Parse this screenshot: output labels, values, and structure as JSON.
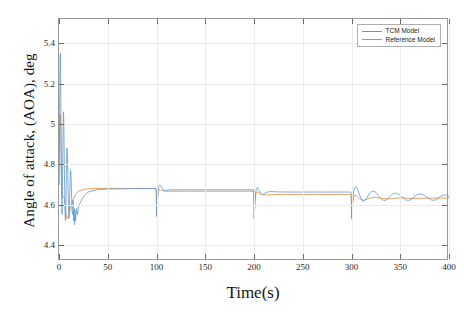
{
  "figure": {
    "background": "#ffffff",
    "top_cut_text": ""
  },
  "axis": {
    "ylabel": "Angle of attack, (AOA), deg",
    "xlabel": "Time(s)",
    "y_ticks": [
      "4.4",
      "4.6",
      "4.8",
      "5",
      "5.2",
      "5.4"
    ],
    "x_ticks": [
      "0",
      "50",
      "100",
      "150",
      "200",
      "250",
      "300",
      "350",
      "400"
    ]
  },
  "legend": {
    "position": "top-right",
    "items": [
      {
        "label": "TCM Model",
        "color": "#5B9BD5"
      },
      {
        "label": "Reference Model",
        "color": "#E08A3C"
      }
    ]
  },
  "chart_data": {
    "type": "line",
    "title": "",
    "xlabel": "Time(s)",
    "ylabel": "Angle of attack, (AOA), deg",
    "xlim": [
      0,
      400
    ],
    "ylim": [
      4.32,
      5.52
    ],
    "xticks": [
      0,
      50,
      100,
      150,
      200,
      250,
      300,
      350,
      400
    ],
    "yticks": [
      4.4,
      4.6,
      4.8,
      5.0,
      5.2,
      5.4
    ],
    "grid": true,
    "legend_position": "upper right",
    "annotations": [
      {
        "t": 3,
        "note": "startup overshoot peak ~5.35 deg"
      },
      {
        "t": 100,
        "note": "step disturbance, downward spike to ~4.53 deg"
      },
      {
        "t": 200,
        "note": "step disturbance, downward spike to ~4.52 deg"
      },
      {
        "t": 300,
        "note": "step disturbance, sustained ringing in TCM Model"
      }
    ],
    "series": [
      {
        "name": "TCM Model",
        "color": "#5B9BD5",
        "points": [
          [
            0,
            4.7
          ],
          [
            0.6,
            5.05
          ],
          [
            1.1,
            5.33
          ],
          [
            1.5,
            5.35
          ],
          [
            1.9,
            5.12
          ],
          [
            2.3,
            4.8
          ],
          [
            2.7,
            4.62
          ],
          [
            3.1,
            4.55
          ],
          [
            3.4,
            4.62
          ],
          [
            3.8,
            4.8
          ],
          [
            4.2,
            4.98
          ],
          [
            4.6,
            5.06
          ],
          [
            5.0,
            4.99
          ],
          [
            5.4,
            4.84
          ],
          [
            5.8,
            4.68
          ],
          [
            6.2,
            4.56
          ],
          [
            6.6,
            4.52
          ],
          [
            7.0,
            4.58
          ],
          [
            7.4,
            4.7
          ],
          [
            7.8,
            4.82
          ],
          [
            8.2,
            4.88
          ],
          [
            8.6,
            4.86
          ],
          [
            9.0,
            4.77
          ],
          [
            9.4,
            4.66
          ],
          [
            9.8,
            4.57
          ],
          [
            10.2,
            4.53
          ],
          [
            10.6,
            4.56
          ],
          [
            11.0,
            4.64
          ],
          [
            11.4,
            4.72
          ],
          [
            11.8,
            4.77
          ],
          [
            12.2,
            4.76
          ],
          [
            12.6,
            4.7
          ],
          [
            13.0,
            4.63
          ],
          [
            13.4,
            4.57
          ],
          [
            13.8,
            4.55
          ],
          [
            14.2,
            4.57
          ],
          [
            14.6,
            4.62
          ],
          [
            15.0,
            4.52
          ],
          [
            15.5,
            4.58
          ],
          [
            16,
            4.5
          ],
          [
            16.5,
            4.57
          ],
          [
            17,
            4.52
          ],
          [
            18,
            4.58
          ],
          [
            19,
            4.55
          ],
          [
            20,
            4.59
          ],
          [
            22,
            4.61
          ],
          [
            24,
            4.63
          ],
          [
            26,
            4.645
          ],
          [
            28,
            4.655
          ],
          [
            30,
            4.662
          ],
          [
            34,
            4.668
          ],
          [
            38,
            4.672
          ],
          [
            44,
            4.675
          ],
          [
            52,
            4.677
          ],
          [
            64,
            4.678
          ],
          [
            80,
            4.679
          ],
          [
            99.4,
            4.679
          ],
          [
            99.8,
            4.66
          ],
          [
            100.0,
            4.6
          ],
          [
            100.2,
            4.545
          ],
          [
            100.5,
            4.575
          ],
          [
            101,
            4.625
          ],
          [
            101.6,
            4.665
          ],
          [
            102.3,
            4.688
          ],
          [
            103.2,
            4.697
          ],
          [
            104.2,
            4.694
          ],
          [
            105.4,
            4.684
          ],
          [
            106.8,
            4.674
          ],
          [
            108.4,
            4.67
          ],
          [
            110,
            4.67
          ],
          [
            113,
            4.672
          ],
          [
            118,
            4.673
          ],
          [
            126,
            4.673
          ],
          [
            140,
            4.673
          ],
          [
            170,
            4.673
          ],
          [
            199.4,
            4.673
          ],
          [
            199.8,
            4.655
          ],
          [
            200.0,
            4.595
          ],
          [
            200.2,
            4.535
          ],
          [
            200.5,
            4.565
          ],
          [
            201,
            4.615
          ],
          [
            201.6,
            4.655
          ],
          [
            202.3,
            4.677
          ],
          [
            203.2,
            4.684
          ],
          [
            204.2,
            4.68
          ],
          [
            205.4,
            4.668
          ],
          [
            206.8,
            4.656
          ],
          [
            208.2,
            4.65
          ],
          [
            209.8,
            4.651
          ],
          [
            211.6,
            4.657
          ],
          [
            213.6,
            4.662
          ],
          [
            216,
            4.664
          ],
          [
            219,
            4.664
          ],
          [
            224,
            4.663
          ],
          [
            232,
            4.662
          ],
          [
            246,
            4.662
          ],
          [
            268,
            4.662
          ],
          [
            299.4,
            4.662
          ],
          [
            299.8,
            4.645
          ],
          [
            300.0,
            4.59
          ],
          [
            300.2,
            4.535
          ],
          [
            300.6,
            4.572
          ],
          [
            301.3,
            4.624
          ],
          [
            302.2,
            4.663
          ],
          [
            303.3,
            4.684
          ],
          [
            304.6,
            4.688
          ],
          [
            306,
            4.678
          ],
          [
            307.6,
            4.658
          ],
          [
            309.2,
            4.637
          ],
          [
            310.8,
            4.622
          ],
          [
            312.4,
            4.616
          ],
          [
            314.2,
            4.622
          ],
          [
            316.2,
            4.637
          ],
          [
            318.4,
            4.654
          ],
          [
            320.6,
            4.665
          ],
          [
            322.8,
            4.667
          ],
          [
            325,
            4.66
          ],
          [
            327.4,
            4.646
          ],
          [
            329.8,
            4.632
          ],
          [
            332.2,
            4.622
          ],
          [
            334.6,
            4.62
          ],
          [
            337,
            4.627
          ],
          [
            339.6,
            4.64
          ],
          [
            342.2,
            4.652
          ],
          [
            344.8,
            4.657
          ],
          [
            347.4,
            4.654
          ],
          [
            350,
            4.645
          ],
          [
            352.8,
            4.633
          ],
          [
            355.6,
            4.623
          ],
          [
            358.4,
            4.62
          ],
          [
            361.2,
            4.625
          ],
          [
            364,
            4.637
          ],
          [
            367,
            4.648
          ],
          [
            370,
            4.653
          ],
          [
            373,
            4.65
          ],
          [
            376,
            4.641
          ],
          [
            379,
            4.63
          ],
          [
            382,
            4.622
          ],
          [
            385,
            4.621
          ],
          [
            388,
            4.628
          ],
          [
            391,
            4.639
          ],
          [
            394,
            4.647
          ],
          [
            397,
            4.647
          ],
          [
            400,
            4.64
          ]
        ]
      },
      {
        "name": "Reference Model",
        "color": "#E08A3C",
        "points": [
          [
            0,
            4.7
          ],
          [
            0.5,
            4.92
          ],
          [
            0.9,
            5.04
          ],
          [
            1.3,
            5.05
          ],
          [
            1.7,
            4.98
          ],
          [
            2.1,
            4.88
          ],
          [
            2.5,
            4.78
          ],
          [
            2.9,
            4.7
          ],
          [
            3.3,
            4.66
          ],
          [
            3.7,
            4.645
          ],
          [
            4.2,
            4.64
          ],
          [
            4.8,
            4.635
          ],
          [
            5.6,
            4.63
          ],
          [
            6.6,
            4.585
          ],
          [
            7.4,
            4.55
          ],
          [
            8.2,
            4.53
          ],
          [
            9.2,
            4.535
          ],
          [
            10.2,
            4.55
          ],
          [
            11.4,
            4.575
          ],
          [
            12.8,
            4.6
          ],
          [
            14.4,
            4.625
          ],
          [
            16.2,
            4.645
          ],
          [
            18.2,
            4.658
          ],
          [
            20.4,
            4.666
          ],
          [
            23,
            4.672
          ],
          [
            26,
            4.676
          ],
          [
            30,
            4.678
          ],
          [
            36,
            4.679
          ],
          [
            46,
            4.68
          ],
          [
            64,
            4.68
          ],
          [
            90,
            4.68
          ],
          [
            99.5,
            4.68
          ],
          [
            99.8,
            4.655
          ],
          [
            100.0,
            4.6
          ],
          [
            100.2,
            4.54
          ],
          [
            100.5,
            4.57
          ],
          [
            101,
            4.62
          ],
          [
            101.7,
            4.658
          ],
          [
            102.6,
            4.673
          ],
          [
            103.8,
            4.674
          ],
          [
            105.2,
            4.67
          ],
          [
            107,
            4.667
          ],
          [
            109,
            4.666
          ],
          [
            112,
            4.666
          ],
          [
            118,
            4.666
          ],
          [
            130,
            4.666
          ],
          [
            160,
            4.666
          ],
          [
            199.5,
            4.666
          ],
          [
            199.8,
            4.645
          ],
          [
            200.0,
            4.59
          ],
          [
            200.2,
            4.53
          ],
          [
            200.5,
            4.56
          ],
          [
            201,
            4.61
          ],
          [
            201.7,
            4.648
          ],
          [
            202.6,
            4.662
          ],
          [
            203.8,
            4.662
          ],
          [
            205.2,
            4.656
          ],
          [
            207,
            4.65
          ],
          [
            209,
            4.648
          ],
          [
            212,
            4.648
          ],
          [
            218,
            4.649
          ],
          [
            230,
            4.65
          ],
          [
            260,
            4.65
          ],
          [
            299.5,
            4.65
          ],
          [
            299.8,
            4.632
          ],
          [
            300.0,
            4.58
          ],
          [
            300.2,
            4.528
          ],
          [
            300.6,
            4.56
          ],
          [
            301.3,
            4.605
          ],
          [
            302.2,
            4.634
          ],
          [
            303.4,
            4.645
          ],
          [
            304.8,
            4.645
          ],
          [
            306.4,
            4.638
          ],
          [
            308.2,
            4.629
          ],
          [
            310.2,
            4.623
          ],
          [
            312.4,
            4.621
          ],
          [
            315,
            4.625
          ],
          [
            318,
            4.631
          ],
          [
            321.4,
            4.635
          ],
          [
            325,
            4.635
          ],
          [
            329,
            4.632
          ],
          [
            333,
            4.629
          ],
          [
            337.4,
            4.628
          ],
          [
            342,
            4.63
          ],
          [
            347,
            4.632
          ],
          [
            352,
            4.633
          ],
          [
            357,
            4.632
          ],
          [
            362,
            4.63
          ],
          [
            367,
            4.63
          ],
          [
            373,
            4.631
          ],
          [
            380,
            4.632
          ],
          [
            388,
            4.632
          ],
          [
            394,
            4.632
          ],
          [
            400,
            4.632
          ]
        ]
      }
    ]
  }
}
